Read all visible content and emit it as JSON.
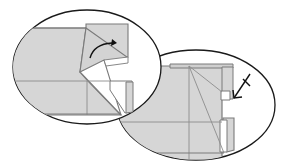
{
  "diagram": {
    "type": "origami-step-diagram",
    "background": "#ffffff",
    "colors": {
      "paper": "#d6d6d6",
      "paper_white": "#ffffff",
      "edge": "#7a7a7a",
      "crease": "#8c8c8c",
      "outline": "#1a1a1a",
      "arrow": "#111111"
    },
    "panels": [
      {
        "id": "left-detail",
        "label": "",
        "arrow": "curved-fold-arrow"
      },
      {
        "id": "right-detail",
        "label": "",
        "arrow": "push-in-arrow"
      }
    ]
  }
}
